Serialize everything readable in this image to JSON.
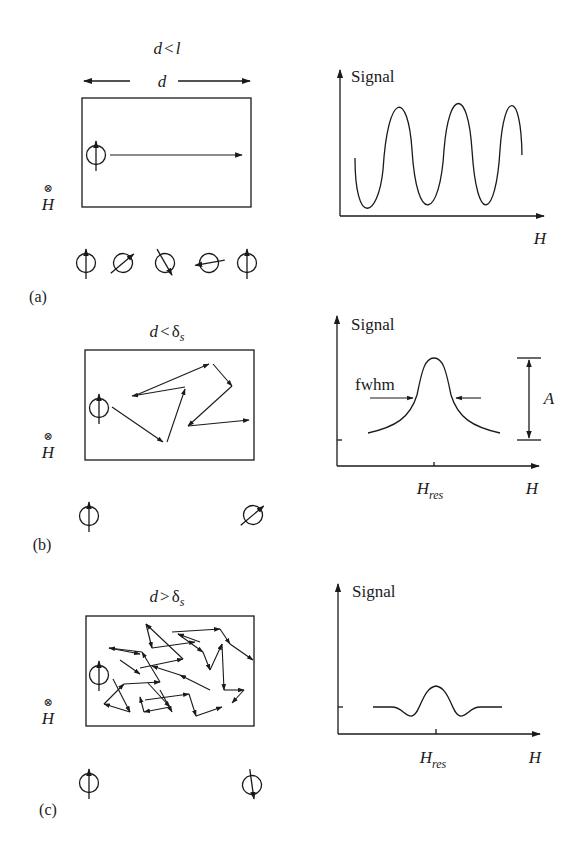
{
  "panels": [
    {
      "label": "(a)",
      "condition": {
        "main": "d",
        "op": "<",
        "rhs": "l",
        "sub": ""
      },
      "dimension_label": "d",
      "field_label": "H",
      "field_symbol": "⊗",
      "graph": {
        "y_label": "Signal",
        "x_label": "H",
        "curve": "oscillating"
      }
    },
    {
      "label": "(b)",
      "condition": {
        "main": "d",
        "op": "<",
        "rhs": "δ",
        "sub": "s"
      },
      "field_label": "H",
      "field_symbol": "⊗",
      "graph": {
        "y_label": "Signal",
        "x_label": "H",
        "tick_label_main": "H",
        "tick_label_sub": "res",
        "fwhm_label": "fwhm",
        "amplitude_label": "A",
        "curve": "lorentzian-peak"
      }
    },
    {
      "label": "(c)",
      "condition": {
        "main": "d",
        "op": ">",
        "rhs": "δ",
        "sub": "s"
      },
      "field_label": "H",
      "field_symbol": "⊗",
      "graph": {
        "y_label": "Signal",
        "x_label": "H",
        "tick_label_main": "H",
        "tick_label_sub": "res",
        "curve": "small-peak-with-dips"
      }
    }
  ]
}
